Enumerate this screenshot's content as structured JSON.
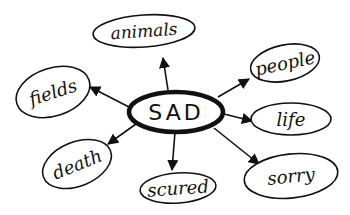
{
  "diagram": {
    "type": "mind-map",
    "style": "hand-drawn",
    "ink_color": "#111111",
    "background": "#ffffff",
    "center": {
      "id": "sad",
      "label": "SAD",
      "cx": 176,
      "cy": 112,
      "rx": 47,
      "ry": 20
    },
    "nodes": [
      {
        "id": "animals",
        "label": "animals",
        "cx": 144,
        "cy": 31,
        "rx": 51,
        "ry": 16,
        "rot": -4,
        "arrow": {
          "x1": 168,
          "y1": 90,
          "x2": 163,
          "y2": 58
        }
      },
      {
        "id": "people",
        "label": "people",
        "cx": 285,
        "cy": 63,
        "rx": 35,
        "ry": 18,
        "rot": -12,
        "arrow": {
          "x1": 218,
          "y1": 97,
          "x2": 249,
          "y2": 79
        }
      },
      {
        "id": "life",
        "label": "life",
        "cx": 291,
        "cy": 119,
        "rx": 40,
        "ry": 16,
        "rot": 0,
        "arrow": {
          "x1": 224,
          "y1": 114,
          "x2": 252,
          "y2": 121
        }
      },
      {
        "id": "sorry",
        "label": "sorry",
        "cx": 291,
        "cy": 176,
        "rx": 47,
        "ry": 22,
        "rot": -6,
        "arrow": {
          "x1": 214,
          "y1": 128,
          "x2": 259,
          "y2": 164
        }
      },
      {
        "id": "scured",
        "label": "scured",
        "cx": 178,
        "cy": 188,
        "rx": 38,
        "ry": 15,
        "rot": -4,
        "arrow": {
          "x1": 175,
          "y1": 132,
          "x2": 172,
          "y2": 170
        }
      },
      {
        "id": "death",
        "label": "death",
        "cx": 77,
        "cy": 164,
        "rx": 36,
        "ry": 22,
        "rot": -22,
        "arrow": {
          "x1": 136,
          "y1": 124,
          "x2": 108,
          "y2": 144
        }
      },
      {
        "id": "fields",
        "label": "fields",
        "cx": 53,
        "cy": 92,
        "rx": 38,
        "ry": 24,
        "rot": -18,
        "arrow": {
          "x1": 129,
          "y1": 107,
          "x2": 90,
          "y2": 87
        }
      }
    ]
  }
}
